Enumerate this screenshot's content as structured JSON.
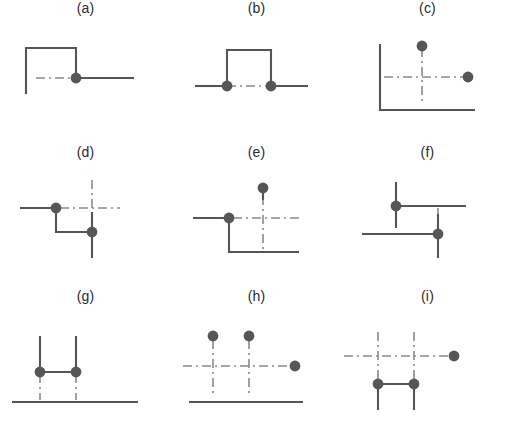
{
  "figure": {
    "title": "",
    "background_color": "#ffffff",
    "line_color": "#555555",
    "dot_color": "#565656",
    "dash_color": "#8a8a8a",
    "label_color": "#2b2b2b",
    "width": 513,
    "height": 432,
    "rows": 3,
    "columns": 3
  },
  "chart_data": {
    "type": "diagram-grid",
    "title": "",
    "xlabel": "",
    "ylabel": "",
    "panel_size": [
      171,
      144
    ],
    "viewbox": [
      0,
      0,
      171,
      122
    ],
    "panels": [
      {
        "id": "a",
        "label": "(a)",
        "row": 0,
        "col": 0,
        "solid_paths": [
          [
            [
              26,
              72
            ],
            [
              26,
              26
            ],
            [
              76,
              26
            ],
            [
              76,
              56
            ]
          ],
          [
            [
              76,
              56
            ],
            [
              134,
              56
            ]
          ]
        ],
        "dash_paths": [
          [
            [
              36,
              56
            ],
            [
              76,
              56
            ]
          ]
        ],
        "dots": [
          [
            76,
            56
          ]
        ]
      },
      {
        "id": "b",
        "label": "(b)",
        "row": 0,
        "col": 1,
        "solid_paths": [
          [
            [
              24,
              64
            ],
            [
              56,
              64
            ]
          ],
          [
            [
              56,
              64
            ],
            [
              56,
              28
            ],
            [
              100,
              28
            ],
            [
              100,
              64
            ]
          ],
          [
            [
              100,
              64
            ],
            [
              137,
              64
            ]
          ]
        ],
        "dash_paths": [
          [
            [
              56,
              64
            ],
            [
              100,
              64
            ]
          ]
        ],
        "dots": [
          [
            56,
            64
          ],
          [
            100,
            64
          ]
        ]
      },
      {
        "id": "c",
        "label": "(c)",
        "row": 0,
        "col": 2,
        "solid_paths": [
          [
            [
              38,
              22
            ],
            [
              38,
              88
            ],
            [
              133,
              88
            ]
          ]
        ],
        "dash_paths": [
          [
            [
              42,
              55
            ],
            [
              125,
              55
            ]
          ],
          [
            [
              80,
              26
            ],
            [
              80,
              80
            ]
          ]
        ],
        "dots": [
          [
            80,
            24
          ],
          [
            126,
            55
          ]
        ]
      },
      {
        "id": "d",
        "label": "(d)",
        "row": 1,
        "col": 0,
        "solid_paths": [
          [
            [
              20,
              42
            ],
            [
              56,
              42
            ]
          ],
          [
            [
              56,
              42
            ],
            [
              56,
              66
            ],
            [
              92,
              66
            ]
          ],
          [
            [
              92,
              46
            ],
            [
              92,
              92
            ]
          ]
        ],
        "dash_paths": [
          [
            [
              60,
              42
            ],
            [
              120,
              42
            ]
          ],
          [
            [
              92,
              14
            ],
            [
              92,
              52
            ]
          ]
        ],
        "dots": [
          [
            56,
            42
          ],
          [
            92,
            66
          ]
        ]
      },
      {
        "id": "e",
        "label": "(e)",
        "row": 1,
        "col": 1,
        "solid_paths": [
          [
            [
              22,
              52
            ],
            [
              58,
              52
            ]
          ],
          [
            [
              58,
              52
            ],
            [
              58,
              86
            ],
            [
              128,
              86
            ]
          ],
          [
            [
              92,
              24
            ],
            [
              92,
              34
            ]
          ]
        ],
        "dash_paths": [
          [
            [
              62,
              52
            ],
            [
              130,
              52
            ]
          ],
          [
            [
              92,
              30
            ],
            [
              92,
              84
            ]
          ]
        ],
        "dots": [
          [
            58,
            52
          ],
          [
            92,
            22
          ]
        ]
      },
      {
        "id": "f",
        "label": "(f)",
        "row": 1,
        "col": 2,
        "solid_paths": [
          [
            [
              54,
              16
            ],
            [
              54,
              62
            ]
          ],
          [
            [
              54,
              40
            ],
            [
              124,
              40
            ]
          ],
          [
            [
              20,
              68
            ],
            [
              96,
              68
            ]
          ],
          [
            [
              96,
              48
            ],
            [
              96,
              92
            ]
          ]
        ],
        "dash_paths": [
          [
            [
              96,
              42
            ],
            [
              96,
              64
            ]
          ]
        ],
        "dots": [
          [
            54,
            40
          ],
          [
            96,
            68
          ]
        ]
      },
      {
        "id": "g",
        "label": "(g)",
        "row": 2,
        "col": 0,
        "solid_paths": [
          [
            [
              12,
              92
            ],
            [
              138,
              92
            ]
          ],
          [
            [
              40,
              26
            ],
            [
              40,
              62
            ]
          ],
          [
            [
              76,
              26
            ],
            [
              76,
              62
            ]
          ],
          [
            [
              40,
              62
            ],
            [
              76,
              62
            ]
          ]
        ],
        "dash_paths": [
          [
            [
              40,
              64
            ],
            [
              40,
              90
            ]
          ],
          [
            [
              76,
              64
            ],
            [
              76,
              90
            ]
          ]
        ],
        "dots": [
          [
            40,
            62
          ],
          [
            76,
            62
          ]
        ]
      },
      {
        "id": "h",
        "label": "(h)",
        "row": 2,
        "col": 1,
        "solid_paths": [
          [
            [
              18,
              92
            ],
            [
              132,
              92
            ]
          ]
        ],
        "dash_paths": [
          [
            [
              12,
              56
            ],
            [
              122,
              56
            ]
          ],
          [
            [
              42,
              30
            ],
            [
              42,
              86
            ]
          ],
          [
            [
              78,
              30
            ],
            [
              78,
              86
            ]
          ]
        ],
        "dots": [
          [
            42,
            26
          ],
          [
            78,
            26
          ],
          [
            124,
            56
          ]
        ]
      },
      {
        "id": "i",
        "label": "(i)",
        "row": 2,
        "col": 2,
        "solid_paths": [
          [
            [
              36,
              74
            ],
            [
              72,
              74
            ]
          ],
          [
            [
              36,
              74
            ],
            [
              36,
              100
            ]
          ],
          [
            [
              72,
              74
            ],
            [
              72,
              100
            ]
          ]
        ],
        "dash_paths": [
          [
            [
              2,
              46
            ],
            [
              110,
              46
            ]
          ],
          [
            [
              36,
              22
            ],
            [
              36,
              70
            ]
          ],
          [
            [
              72,
              22
            ],
            [
              72,
              70
            ]
          ]
        ],
        "dots": [
          [
            36,
            74
          ],
          [
            72,
            74
          ],
          [
            112,
            46
          ]
        ]
      }
    ]
  }
}
